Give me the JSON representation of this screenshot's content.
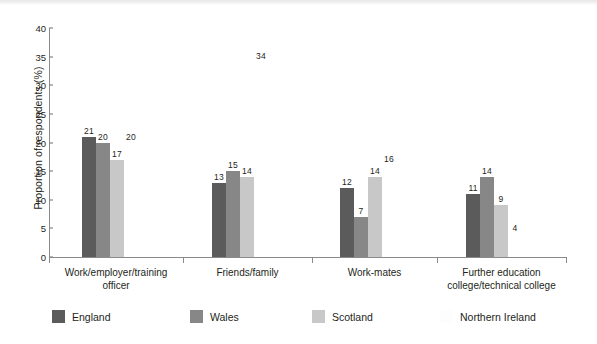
{
  "chart_data": {
    "type": "bar",
    "title": "",
    "xlabel": "",
    "ylabel": "Proportion of respondents (%)",
    "ylim": [
      0,
      40
    ],
    "yticks": [
      0,
      5,
      10,
      15,
      20,
      25,
      30,
      35,
      40
    ],
    "grid": false,
    "legend_position": "bottom",
    "categories": [
      "Work/employer/training officer",
      "Friends/family",
      "Work-mates",
      "Further education college/technical college"
    ],
    "category_lines": [
      [
        "Work/employer/training",
        "officer"
      ],
      [
        "Friends/family"
      ],
      [
        "Work-mates"
      ],
      [
        "Further education",
        "college/technical college"
      ]
    ],
    "series": [
      {
        "name": "England",
        "color": "#5b5b5b",
        "values": [
          21,
          13,
          12,
          11
        ]
      },
      {
        "name": "Wales",
        "color": "#878787",
        "values": [
          20,
          15,
          7,
          14
        ]
      },
      {
        "name": "Scotland",
        "color": "#c8c8c8",
        "values": [
          17,
          14,
          14,
          9
        ]
      },
      {
        "name": "Northern Ireland",
        "color": "#ffffff",
        "values": [
          20,
          34,
          16,
          4
        ]
      }
    ]
  }
}
